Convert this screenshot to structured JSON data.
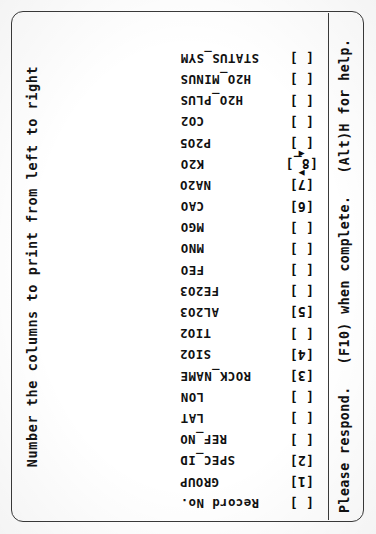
{
  "window": {
    "title": "Number the columns to print from left to right",
    "frame_color": "#3a3a3a",
    "text_color": "#111111",
    "background": "#ffffff"
  },
  "form": {
    "open_bracket": "[",
    "close_bracket": "]",
    "cursor_up_glyph": "▲",
    "cursor_down_glyph": "▼",
    "cursor_field_value": "8_",
    "fields": [
      {
        "label": "Record No.",
        "value": "",
        "cursor": false
      },
      {
        "label": "GROUP",
        "value": "1",
        "cursor": false
      },
      {
        "label": "SPEC_ID",
        "value": "2",
        "cursor": false
      },
      {
        "label": "REF_NO",
        "value": "",
        "cursor": false
      },
      {
        "label": "LAT",
        "value": "",
        "cursor": false
      },
      {
        "label": "LON",
        "value": "",
        "cursor": false
      },
      {
        "label": "ROCK_NAME",
        "value": "3",
        "cursor": false
      },
      {
        "label": "SIO2",
        "value": "4",
        "cursor": false
      },
      {
        "label": "TIO2",
        "value": "",
        "cursor": false
      },
      {
        "label": "AL2O3",
        "value": "5",
        "cursor": false
      },
      {
        "label": "FE2O3",
        "value": "",
        "cursor": false
      },
      {
        "label": "FEO",
        "value": "",
        "cursor": false
      },
      {
        "label": "MNO",
        "value": "",
        "cursor": false
      },
      {
        "label": "MGO",
        "value": "",
        "cursor": false
      },
      {
        "label": "CAO",
        "value": "6",
        "cursor": false
      },
      {
        "label": "NA2O",
        "value": "7",
        "cursor": false
      },
      {
        "label": "K2O",
        "value": "8_",
        "cursor": true
      },
      {
        "label": "P2O5",
        "value": "",
        "cursor": false
      },
      {
        "label": "CO2",
        "value": "",
        "cursor": false
      },
      {
        "label": "H2O_PLUS",
        "value": "",
        "cursor": false
      },
      {
        "label": "H2O_MINUS",
        "value": "",
        "cursor": false
      },
      {
        "label": "STATUS_SYM",
        "value": "",
        "cursor": false
      }
    ]
  },
  "status_bar": {
    "prompt": "Please respond.",
    "complete_hint": "(F10) when complete.",
    "help_hint": "(Alt)H for help."
  }
}
